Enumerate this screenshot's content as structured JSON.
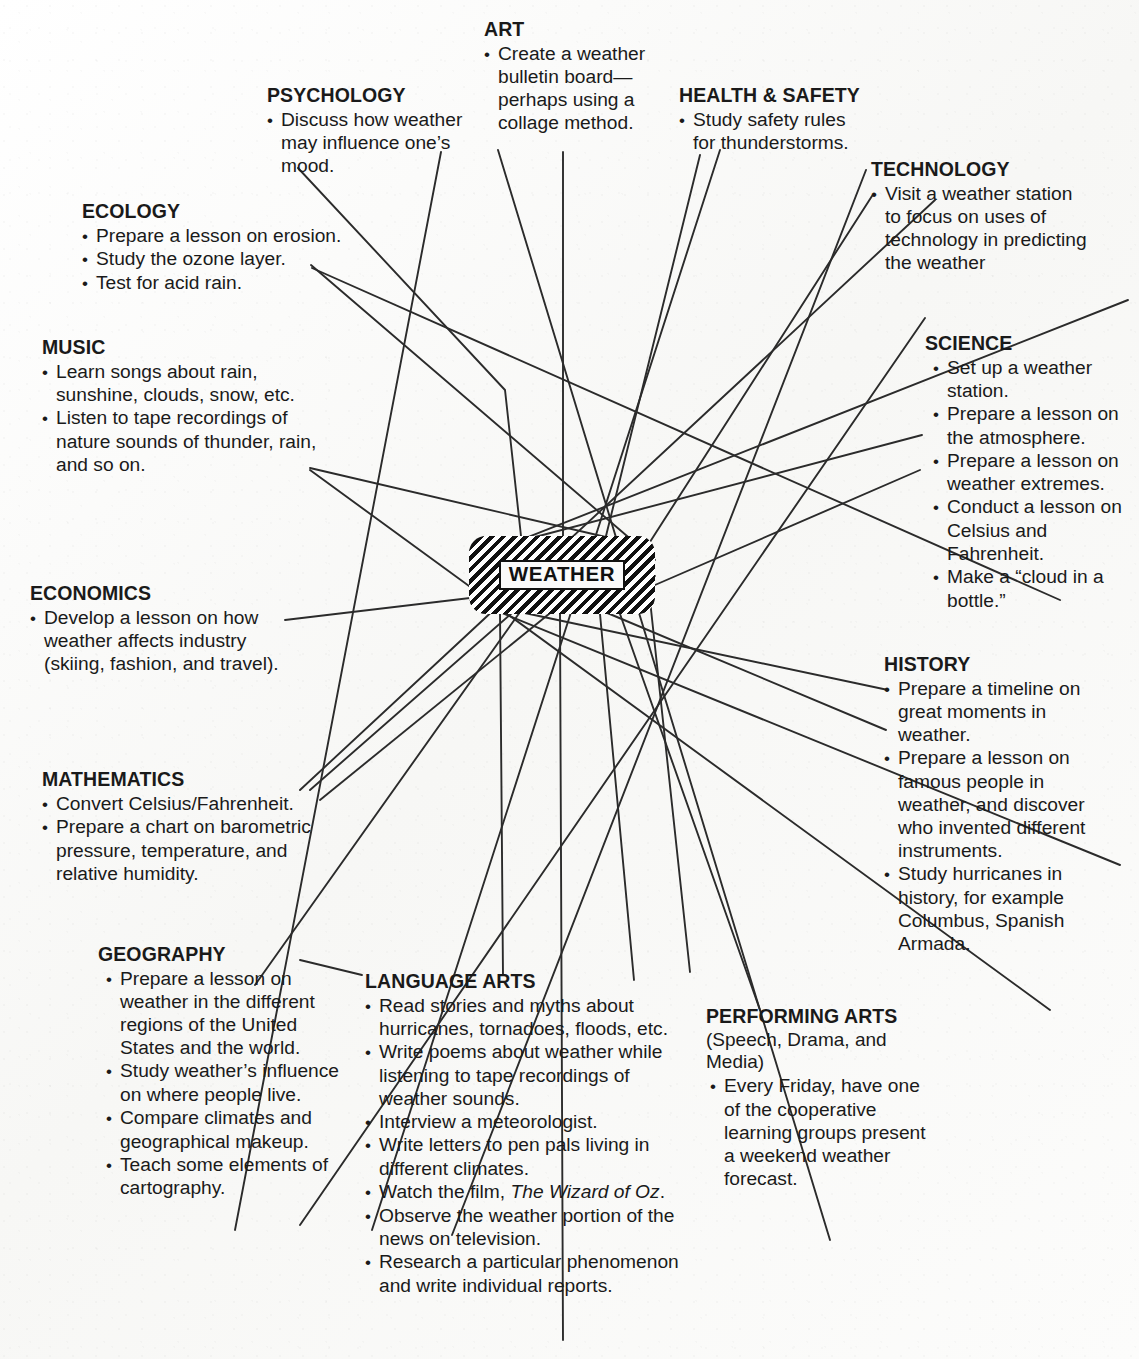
{
  "center": {
    "label": "WEATHER"
  },
  "nodes": [
    {
      "id": "art",
      "title": "ART",
      "subhead": "",
      "items": [
        "Create a weather bulletin board—perhaps using a collage method."
      ]
    },
    {
      "id": "psychology",
      "title": "PSYCHOLOGY",
      "subhead": "",
      "items": [
        "Discuss how weather may influence one’s mood."
      ]
    },
    {
      "id": "health-safety",
      "title": "HEALTH & SAFETY",
      "subhead": "",
      "items": [
        "Study safety rules for thunderstorms."
      ]
    },
    {
      "id": "technology",
      "title": "TECHNOLOGY",
      "subhead": "",
      "items": [
        "Visit a weather station to focus on uses of technology in predicting the weather"
      ]
    },
    {
      "id": "ecology",
      "title": "ECOLOGY",
      "subhead": "",
      "items": [
        "Prepare a lesson on erosion.",
        "Study the ozone layer.",
        "Test for acid rain."
      ]
    },
    {
      "id": "science",
      "title": "SCIENCE",
      "subhead": "",
      "items": [
        "Set up a weather station.",
        "Prepare a lesson on the atmosphere.",
        "Prepare a lesson on weather extremes.",
        "Conduct a lesson on Celsius and Fahrenheit.",
        "Make a “cloud in a bottle.”"
      ]
    },
    {
      "id": "music",
      "title": "MUSIC",
      "subhead": "",
      "items": [
        "Learn songs about rain, sunshine, clouds, snow, etc.",
        "Listen to tape recordings of nature sounds of thunder, rain, and so on."
      ]
    },
    {
      "id": "economics",
      "title": "ECONOMICS",
      "subhead": "",
      "items": [
        "Develop a lesson on how weather affects industry (skiing, fashion, and travel)."
      ]
    },
    {
      "id": "history",
      "title": "HISTORY",
      "subhead": "",
      "items": [
        "Prepare a timeline on great moments in weather.",
        "Prepare a lesson on famous people in weather, and discover who invented different instruments.",
        "Study hurricanes in history, for example Columbus, Spanish Armada."
      ]
    },
    {
      "id": "mathematics",
      "title": "MATHEMATICS",
      "subhead": "",
      "items": [
        "Convert Celsius/Fahrenheit.",
        "Prepare a chart on barometric pressure, temperature, and relative humidity."
      ]
    },
    {
      "id": "geography",
      "title": "GEOGRAPHY",
      "subhead": "",
      "items": [
        "Prepare a lesson on weather in the different regions of the United States and the world.",
        "Study weather’s influence on where people live.",
        "Compare climates and geographical makeup.",
        "Teach some elements of cartography."
      ]
    },
    {
      "id": "language-arts",
      "title": "LANGUAGE ARTS",
      "subhead": "",
      "items": [
        "Read stories and myths about hurricanes, tornadoes, floods, etc.",
        "Write poems about weather while listening to tape recordings of weather sounds.",
        "Interview a meteorologist.",
        "Write letters to pen pals living in different climates.",
        "Watch the film, The Wizard of Oz.",
        "Observe the weather portion of the news on television.",
        "Research a particular phenomenon and write individual reports."
      ],
      "italic_in_item": "The Wizard of Oz"
    },
    {
      "id": "performing-arts",
      "title": "PERFORMING ARTS",
      "subhead": "(Speech, Drama, and Media)",
      "items": [
        "Every Friday, have one of the cooperative learning groups present a weekend weather forecast."
      ]
    }
  ],
  "colors": {
    "ink": "#1a1a1a",
    "paper": "#fbfbfa",
    "line": "#2b2b2b",
    "center_fill": "#111111"
  }
}
